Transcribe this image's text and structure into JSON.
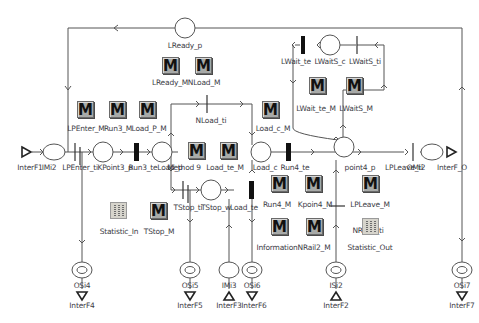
{
  "diagram": {
    "type": "petri-net",
    "places": [
      {
        "id": "LReady_p",
        "label": "LReady_p"
      },
      {
        "id": "LWaitS_c",
        "label": "LWaitS_c"
      },
      {
        "id": "IMi2",
        "label": "IMi2"
      },
      {
        "id": "KPoint3_p",
        "label": "KPoint3_p"
      },
      {
        "id": "Load_p",
        "label": "Load_p"
      },
      {
        "id": "Load_c",
        "label": "Load_c"
      },
      {
        "id": "point4_p",
        "label": "point4_p"
      },
      {
        "id": "OMi2",
        "label": "OMi2"
      },
      {
        "id": "TStop_w",
        "label": "TStop_w"
      },
      {
        "id": "OSi4",
        "label": "OSi4"
      },
      {
        "id": "OSi5",
        "label": "OSi5"
      },
      {
        "id": "IMi3",
        "label": "IMi3"
      },
      {
        "id": "OSi6",
        "label": "OSi6"
      },
      {
        "id": "ISi2",
        "label": "ISi2"
      },
      {
        "id": "OSi7",
        "label": "OSi7"
      }
    ],
    "transitions": [
      {
        "id": "LWait_te",
        "label": "LWait_te",
        "kind": "timed"
      },
      {
        "id": "LWaitS_ti",
        "label": "LWaitS_ti",
        "kind": "immediate"
      },
      {
        "id": "LPEnter_ti",
        "label": "LPEnter_ti",
        "kind": "immediate"
      },
      {
        "id": "Run3_te",
        "label": "Run3_te",
        "kind": "timed"
      },
      {
        "id": "NLoad_ti",
        "label": "NLoad_ti",
        "kind": "immediate"
      },
      {
        "id": "Run4_te",
        "label": "Run4_te",
        "kind": "timed"
      },
      {
        "id": "LPLeave_ti",
        "label": "LPLeave_ti",
        "kind": "immediate"
      },
      {
        "id": "TStop_ti",
        "label": "TStop_ti",
        "kind": "immediate"
      },
      {
        "id": "Load_te",
        "label": "Load_te",
        "kind": "timed"
      },
      {
        "id": "NRail2_ti",
        "label": "NRail2_ti",
        "kind": "immediate"
      }
    ],
    "interfaces": [
      {
        "id": "InterF1",
        "label": "InterF1"
      },
      {
        "id": "InterF_O",
        "label": "InterF_O"
      },
      {
        "id": "InterF4",
        "label": "InterF4"
      },
      {
        "id": "InterF5",
        "label": "InterF5"
      },
      {
        "id": "InterF3",
        "label": "InterF3"
      },
      {
        "id": "InterF6",
        "label": "InterF6"
      },
      {
        "id": "InterF2",
        "label": "InterF2"
      },
      {
        "id": "InterF7",
        "label": "InterF7"
      }
    ],
    "methods": [
      {
        "id": "LReady_M",
        "label": "LReady_M"
      },
      {
        "id": "NLoad_M",
        "label": "NLoad_M"
      },
      {
        "id": "LWait_te_M",
        "label": "LWait_te_M"
      },
      {
        "id": "LWaitS_M",
        "label": "LWaitS_M"
      },
      {
        "id": "LPEnter_M",
        "label": "LPEnter_M"
      },
      {
        "id": "Run3_M",
        "label": "Run3_M"
      },
      {
        "id": "Load_P_M",
        "label": "Load_P_M"
      },
      {
        "id": "Load_c_M",
        "label": "Load_c_M"
      },
      {
        "id": "Method9",
        "label": "Method 9"
      },
      {
        "id": "Load_te_M",
        "label": "Load_te_M"
      },
      {
        "id": "Run4_M",
        "label": "Run4_M"
      },
      {
        "id": "Kpoin4_M",
        "label": "Kpoin4_M"
      },
      {
        "id": "LPLeave_M",
        "label": "LPLeave_M"
      },
      {
        "id": "TStop_M",
        "label": "TStop_M"
      },
      {
        "id": "Information",
        "label": "Information"
      },
      {
        "id": "NRail2_M",
        "label": "NRail2_M"
      }
    ],
    "tables": [
      {
        "id": "Statistic_In",
        "label": "Statistic_In"
      },
      {
        "id": "Statistic_Out",
        "label": "Statistic_Out"
      }
    ],
    "icon_glyph": "M",
    "colors": {
      "line": "#505050",
      "method_fill": "#a8aaa8",
      "timed_bar": "#111111",
      "text": "#3c3c46"
    }
  }
}
